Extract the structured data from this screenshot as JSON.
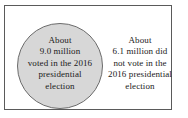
{
  "diagram": {
    "type": "venn-circle-with-complement",
    "frame": {
      "border_color": "#5a5a5a"
    },
    "circle": {
      "name": "voted-circle",
      "fill_color": "#d7d7d7",
      "stroke_color": "#6b6b6b",
      "lines": [
        "About",
        "9.0 million",
        "voted in the 2016",
        "presidential",
        "election"
      ]
    },
    "outside": {
      "name": "did-not-vote-region",
      "lines": [
        "About",
        "6.1 million did",
        "not vote in the",
        "2016 presidential",
        "election"
      ]
    }
  }
}
